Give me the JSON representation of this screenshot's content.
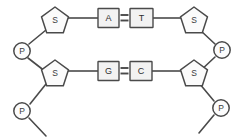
{
  "diagram": {
    "kind": "dna-double-helix-ladder-segment",
    "background_color": "#ffffff",
    "line_color": "#4a4a4a",
    "base_box_fill": "#f2f2f2",
    "sugar_fill": "#fbfbfb",
    "phosphate_fill": "#fcfcfc",
    "base_pairs": [
      {
        "id": "pair-top",
        "left_base": "A",
        "right_base": "T",
        "bond_symbol": "=",
        "bond_count": 2
      },
      {
        "id": "pair-bottom",
        "left_base": "G",
        "right_base": "C",
        "bond_symbol": "=",
        "bond_count": 2
      }
    ],
    "sugars": [
      {
        "id": "sugar-top-left",
        "label": "S"
      },
      {
        "id": "sugar-top-right",
        "label": "S"
      },
      {
        "id": "sugar-bottom-left",
        "label": "S"
      },
      {
        "id": "sugar-bottom-right",
        "label": "S"
      }
    ],
    "phosphates": [
      {
        "id": "phosphate-left-middle",
        "label": "P"
      },
      {
        "id": "phosphate-left-bottom",
        "label": "P"
      },
      {
        "id": "phosphate-right-middle",
        "label": "P"
      },
      {
        "id": "phosphate-right-bottom",
        "label": "P"
      }
    ]
  }
}
